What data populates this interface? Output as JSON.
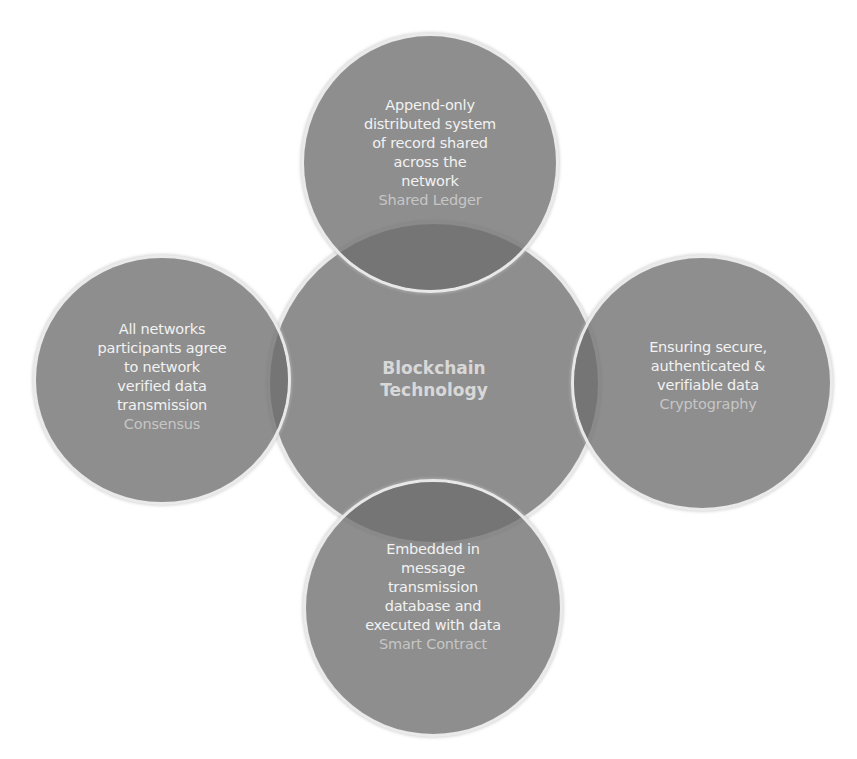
{
  "diagram": {
    "type": "venn-hub",
    "colors": {
      "circle_fill": "#8c8c8c",
      "overlap_fill": "#7a7a7a",
      "circle_border": "#e6e6e6",
      "body_text": "#f2f2f2",
      "caption_text": "#c6c6c6",
      "center_text": "#d8d8d8",
      "background": "#ffffff"
    },
    "center": {
      "title_line1": "Blockchain",
      "title_line2": "Technology"
    },
    "nodes": [
      {
        "position": "top",
        "lines": [
          "Append-only",
          "distributed system",
          "of record shared",
          "across the",
          "network"
        ],
        "caption": "Shared Ledger"
      },
      {
        "position": "left",
        "lines": [
          "All networks",
          "participants agree",
          "to network",
          "verified data",
          "transmission"
        ],
        "caption": "Consensus"
      },
      {
        "position": "right",
        "lines": [
          "Ensuring secure,",
          "authenticated &",
          "verifiable data"
        ],
        "caption": "Cryptography"
      },
      {
        "position": "bottom",
        "lines": [
          "Embedded in",
          "message",
          "transmission",
          "database and",
          "executed with data"
        ],
        "caption": "Smart Contract"
      }
    ]
  }
}
